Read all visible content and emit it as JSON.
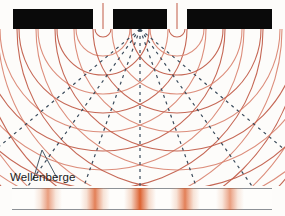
{
  "figure": {
    "title_visible": false,
    "background_color": "#fdfcfa",
    "width": 285,
    "height": 216,
    "annotation": {
      "label": "Wellenberge",
      "label_x": 10,
      "label_y": 171,
      "text_color": "#1a1a1a",
      "leader_color": "#4a5a68",
      "leader_points": "33,180 42,150 57,178"
    }
  },
  "barrier": {
    "color": "#0a0a0a",
    "top": 9,
    "height": 20,
    "blocks": [
      {
        "name": "barrier-block-left",
        "x": 13,
        "width": 80
      },
      {
        "name": "barrier-block-middle",
        "x": 113,
        "width": 54
      },
      {
        "name": "barrier-block-right",
        "x": 187,
        "width": 85
      }
    ],
    "slits": [
      {
        "name": "slit-left",
        "x": 103,
        "width": 20
      },
      {
        "name": "slit-right",
        "x": 177,
        "width": 20
      }
    ]
  },
  "waves": {
    "description": "Two circular wavefront families (Wellenberge / wave crests) emanating from the two slits",
    "crest_color": "#c05a46",
    "crest_color_light": "#d98370",
    "crest_stroke_width": 1.1,
    "sources": [
      {
        "name": "wave-source-left",
        "x": 103,
        "y": 29
      },
      {
        "name": "wave-source-right",
        "x": 177,
        "y": 29
      }
    ],
    "wavelength_px": 19,
    "num_crests": 13,
    "first_radius_px": 8
  },
  "maxima_lines": {
    "description": "Dashed lines of constructive interference (Interferenzmaxima)",
    "color": "#3a4a5a",
    "stroke_width": 1.2,
    "dash": "3 4",
    "origin": {
      "x": 140,
      "y": 29
    },
    "orders": [
      {
        "order": 0,
        "end_x": 140,
        "end_y": 186
      },
      {
        "order": 1,
        "end_x": 196,
        "end_y": 186
      },
      {
        "order": -1,
        "end_x": 84,
        "end_y": 186
      },
      {
        "order": 2,
        "end_x": 252,
        "end_y": 186
      },
      {
        "order": -2,
        "end_x": 28,
        "end_y": 186
      },
      {
        "order": 3,
        "end_x": 285,
        "end_y": 150
      },
      {
        "order": -3,
        "end_x": -5,
        "end_y": 150
      }
    ]
  },
  "chart_data": {
    "type": "line",
    "xlabel": "",
    "ylabel": "",
    "series": [
      {
        "name": "Intensity",
        "x": [
          48,
          95,
          140,
          185,
          230
        ],
        "values": [
          0.62,
          0.8,
          1.0,
          0.8,
          0.62
        ]
      }
    ],
    "annotations": [
      "Wellenberge"
    ]
  },
  "screen": {
    "name": "interference-pattern-strip",
    "left": 12,
    "right": 272,
    "top_rule_y": 188,
    "bottom_rule_y": 210,
    "rule_color": "#8d9196",
    "background": "#fefdfb",
    "fringe_color_core": "#d9541e",
    "fringe_color_mid": "#e08a5c",
    "fringes": [
      {
        "name": "fringe-order-minus-2",
        "center_x": 48,
        "half_width": 14,
        "intensity": 0.62
      },
      {
        "name": "fringe-order-minus-1",
        "center_x": 95,
        "half_width": 15,
        "intensity": 0.8
      },
      {
        "name": "fringe-order-zero",
        "center_x": 140,
        "half_width": 16,
        "intensity": 1.0
      },
      {
        "name": "fringe-order-plus-1",
        "center_x": 185,
        "half_width": 15,
        "intensity": 0.8
      },
      {
        "name": "fringe-order-plus-2",
        "center_x": 230,
        "half_width": 14,
        "intensity": 0.62
      }
    ]
  }
}
